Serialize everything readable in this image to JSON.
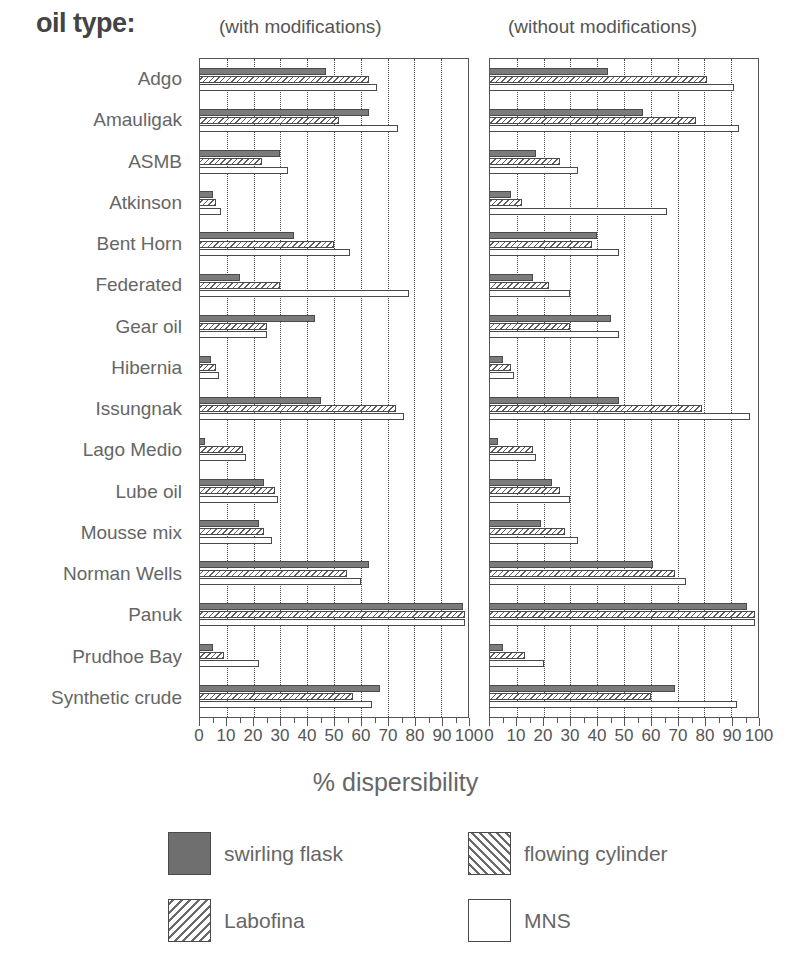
{
  "header": {
    "oil_type_label": "oil type:",
    "panel_left_title": "(with modifications)",
    "panel_right_title": "(without modifications)"
  },
  "axis": {
    "x_title": "% dispersibility",
    "tick_labels": [
      "0",
      "10",
      "20",
      "30",
      "40",
      "50",
      "60",
      "70",
      "80",
      "90",
      "100"
    ]
  },
  "legend": {
    "items": [
      {
        "label": "swirling flask",
        "pattern": "solid-dark"
      },
      {
        "label": "flowing cylinder",
        "pattern": "hatch-up"
      },
      {
        "label": "Labofina",
        "pattern": "hatch-down"
      },
      {
        "label": "MNS",
        "pattern": "empty"
      }
    ]
  },
  "chart_data": {
    "type": "bar",
    "orientation": "horizontal",
    "xlabel": "% dispersibility",
    "ylabel": "oil type",
    "xlim": [
      0,
      100
    ],
    "grid": true,
    "legend_position": "bottom",
    "categories": [
      "Adgo",
      "Amauligak",
      "ASMB",
      "Atkinson",
      "Bent Horn",
      "Federated",
      "Gear oil",
      "Hibernia",
      "Issungnak",
      "Lago Medio",
      "Lube oil",
      "Mousse mix",
      "Norman Wells",
      "Panuk",
      "Prudhoe Bay",
      "Synthetic crude"
    ],
    "panels": [
      {
        "name": "with modifications",
        "series": [
          {
            "name": "swirling flask",
            "values": [
              47,
              63,
              30,
              5,
              35,
              15,
              43,
              4,
              45,
              2,
              24,
              22,
              63,
              98,
              5,
              67
            ]
          },
          {
            "name": "flowing cylinder",
            "values": [
              0,
              0,
              0,
              0,
              0,
              0,
              0,
              0,
              0,
              0,
              0,
              0,
              0,
              0,
              0,
              0
            ]
          },
          {
            "name": "Labofina",
            "values": [
              63,
              52,
              23,
              6,
              50,
              30,
              25,
              6,
              73,
              16,
              28,
              24,
              55,
              99,
              9,
              57
            ]
          },
          {
            "name": "MNS",
            "values": [
              66,
              74,
              33,
              8,
              56,
              78,
              25,
              7,
              76,
              17,
              29,
              27,
              60,
              99,
              22,
              64
            ]
          }
        ]
      },
      {
        "name": "without modifications",
        "series": [
          {
            "name": "swirling flask",
            "values": [
              44,
              57,
              17,
              8,
              40,
              16,
              45,
              5,
              48,
              3,
              23,
              19,
              61,
              96,
              5,
              69
            ]
          },
          {
            "name": "flowing cylinder",
            "values": [
              0,
              0,
              0,
              0,
              0,
              0,
              0,
              0,
              0,
              0,
              0,
              0,
              0,
              0,
              0,
              0
            ]
          },
          {
            "name": "Labofina",
            "values": [
              81,
              77,
              26,
              12,
              38,
              22,
              30,
              8,
              79,
              16,
              26,
              28,
              69,
              99,
              13,
              60
            ]
          },
          {
            "name": "MNS",
            "values": [
              91,
              93,
              33,
              66,
              48,
              30,
              48,
              9,
              97,
              17,
              30,
              33,
              73,
              99,
              20,
              92
            ]
          }
        ]
      }
    ]
  }
}
